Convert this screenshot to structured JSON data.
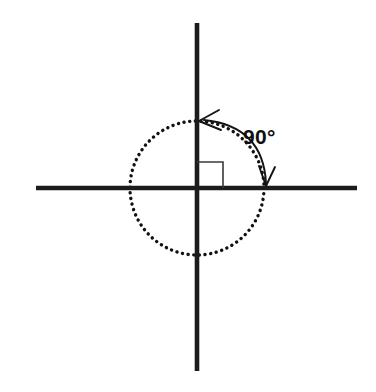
{
  "figure": {
    "kind": "geometry-diagram",
    "background_color": "#ffffff",
    "width": 376,
    "height": 392
  },
  "geometry": {
    "origin": {
      "x": 197,
      "y": 188
    },
    "circle": {
      "name": "dotted-circle",
      "radius": 67,
      "stroke_color": "#111111",
      "dot_diameter": 3.4,
      "dot_gap": 5.6,
      "style": "dotted"
    },
    "vertical_axis": {
      "name": "vertical-axis",
      "x": 197,
      "y_start": 23,
      "y_end": 371,
      "thickness": 4.6,
      "color": "#1c1c1c"
    },
    "horizontal_axis": {
      "name": "horizontal-axis",
      "y": 188,
      "x_start": 36,
      "x_end": 357,
      "thickness": 4.6,
      "color": "#1c1c1c"
    },
    "right_angle_marker": {
      "name": "right-angle-square",
      "corner_x": 197,
      "corner_y": 188,
      "size": 26,
      "quadrant": "upper-right",
      "color": "#3a3a3a"
    },
    "angle_arc": {
      "name": "angle-arc",
      "start_point": {
        "x": 265,
        "y": 186
      },
      "end_point": {
        "x": 200,
        "y": 122
      },
      "bulge_control": {
        "x": 262,
        "y": 124
      },
      "color": "#141414",
      "arrowheads": "both-ends"
    }
  },
  "labels": {
    "angle_measure": "90°",
    "angle_label_x": 243,
    "angle_label_y": 143,
    "angle_label_color": "#101010"
  }
}
